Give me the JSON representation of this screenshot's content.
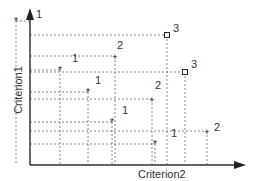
{
  "diagram": {
    "x_axis_label": "Criterion2",
    "y_axis_label": "Criterion1",
    "points": [
      {
        "x": 16,
        "y": 21,
        "marker": "star",
        "rank": "1",
        "lx": 36,
        "ly": 9
      },
      {
        "x": 167,
        "y": 35,
        "marker": "square",
        "rank": "3",
        "lx": 173,
        "ly": 23
      },
      {
        "x": 115,
        "y": 56,
        "marker": "plus",
        "rank": "2",
        "lx": 117,
        "ly": 40
      },
      {
        "x": 60,
        "y": 70,
        "marker": "star",
        "rank": "1",
        "lx": 72,
        "ly": 53
      },
      {
        "x": 185,
        "y": 72,
        "marker": "square",
        "rank": "3",
        "lx": 191,
        "ly": 59
      },
      {
        "x": 88,
        "y": 92,
        "marker": "star",
        "rank": "1",
        "lx": 95,
        "ly": 75
      },
      {
        "x": 152,
        "y": 99,
        "marker": "plus",
        "rank": "2",
        "lx": 155,
        "ly": 80
      },
      {
        "x": 112,
        "y": 122,
        "marker": "star",
        "rank": "1",
        "lx": 122,
        "ly": 105
      },
      {
        "x": 207,
        "y": 131,
        "marker": "plus",
        "rank": "2",
        "lx": 214,
        "ly": 122
      },
      {
        "x": 155,
        "y": 144,
        "marker": "star",
        "rank": "1",
        "lx": 171,
        "ly": 128
      }
    ],
    "colors": {
      "axis": "#333333",
      "grid": "#666666",
      "text": "#333333"
    }
  }
}
